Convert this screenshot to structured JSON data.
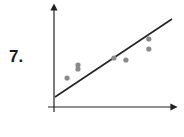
{
  "problem": {
    "number": "7."
  },
  "chart_data": {
    "type": "scatter",
    "title": "",
    "xlabel": "",
    "ylabel": "",
    "grid": false,
    "legend": null,
    "points": [
      {
        "x": 1.2,
        "y": 2.9
      },
      {
        "x": 2.2,
        "y": 4.2
      },
      {
        "x": 2.2,
        "y": 3.8
      },
      {
        "x": 5.5,
        "y": 4.9
      },
      {
        "x": 6.6,
        "y": 4.7
      },
      {
        "x": 8.7,
        "y": 6.8
      },
      {
        "x": 8.7,
        "y": 5.8
      }
    ],
    "trend_line": {
      "x": [
        0,
        10.7
      ],
      "y": [
        1.0,
        8.8
      ]
    },
    "xlim": [
      0,
      11
    ],
    "ylim": [
      0,
      10
    ],
    "colors": {
      "points": "#8a8a8a",
      "line": "#222222",
      "axes": "#222222"
    }
  }
}
